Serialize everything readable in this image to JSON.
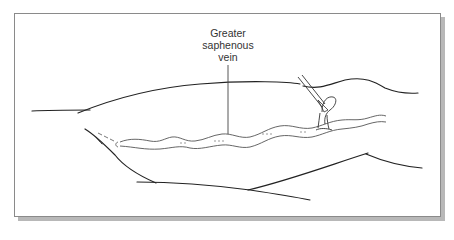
{
  "figure": {
    "type": "medical illustration",
    "labels": [
      {
        "id": "greater-saphenous-vein",
        "lines": [
          "Greater",
          "saphenous",
          "vein"
        ]
      }
    ],
    "colors": {
      "line": "#222222",
      "vein": "#555555",
      "frame_border": "#8a8a8a",
      "frame_shadow": "#b8b8b8",
      "label_text": "#333333"
    }
  }
}
